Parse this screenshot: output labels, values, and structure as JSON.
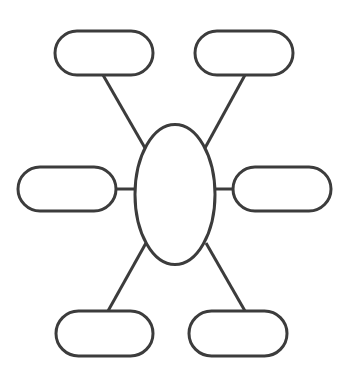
{
  "diagram": {
    "type": "spider-map",
    "stroke_color": "#3c3c3c",
    "fill_color": "#ffffff",
    "background": "#ffffff",
    "center": {
      "shape": "ellipse",
      "label": "",
      "cx": 175,
      "cy": 194.5,
      "rx": 40,
      "ry": 70
    },
    "branches": [
      {
        "id": "top-left",
        "label": "",
        "x": 55,
        "y": 31,
        "w": 98,
        "h": 44
      },
      {
        "id": "top-right",
        "label": "",
        "x": 195,
        "y": 31,
        "w": 98,
        "h": 44
      },
      {
        "id": "middle-left",
        "label": "",
        "x": 18,
        "y": 167,
        "w": 98,
        "h": 44
      },
      {
        "id": "middle-right",
        "label": "",
        "x": 233,
        "y": 167,
        "w": 98,
        "h": 44
      },
      {
        "id": "bottom-left",
        "label": "",
        "x": 56,
        "y": 311,
        "w": 97,
        "h": 45
      },
      {
        "id": "bottom-right",
        "label": "",
        "x": 189,
        "y": 311,
        "w": 98,
        "h": 45
      }
    ]
  }
}
